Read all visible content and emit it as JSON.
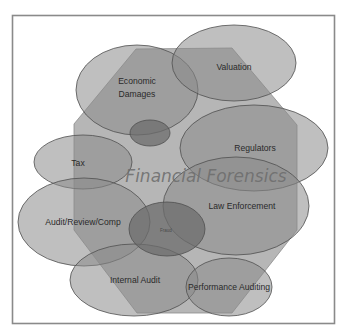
{
  "diagram": {
    "title": "Financial Forensics",
    "colors": {
      "frame_border": "#8a8a8a",
      "octagon_fill": "#a9a9a9",
      "bubble_fill": "#8a8a8a",
      "bubble_stroke": "#4f4f4f",
      "title_color": "#6e6e6e"
    },
    "bubbles": [
      {
        "id": "economic-damages",
        "label_line1": "Economic",
        "label_line2": "Damages"
      },
      {
        "id": "valuation",
        "label": "Valuation"
      },
      {
        "id": "unlabeled-small",
        "label": ""
      },
      {
        "id": "tax",
        "label": "Tax"
      },
      {
        "id": "regulators",
        "label": "Regulators"
      },
      {
        "id": "law-enforcement",
        "label": "Law Enforcement"
      },
      {
        "id": "audit-review-comp",
        "label": "Audit/Review/Comp"
      },
      {
        "id": "fraud",
        "label": "Fraud"
      },
      {
        "id": "internal-audit",
        "label": "Internal Audit"
      },
      {
        "id": "performance-auditing",
        "label": "Performance Auditing"
      }
    ]
  }
}
